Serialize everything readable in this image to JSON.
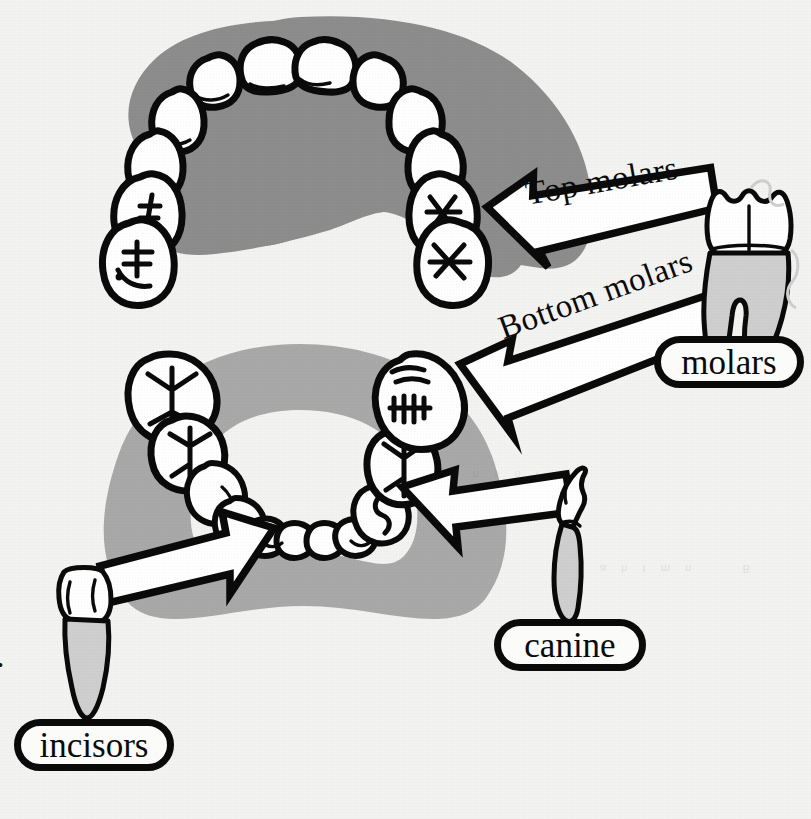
{
  "figure": {
    "background_color": "#f3f3f1",
    "ink_color": "#0a0a0a",
    "tooth_fill": "#ffffff",
    "root_fill": "#cfcfcf",
    "upper_gum_color": "#8d8d8d",
    "lower_gum_color": "#a9a9a9"
  },
  "labels": {
    "molars": "molars",
    "canine": "canine",
    "incisors": "incisors"
  },
  "arrow_labels": {
    "top_molars": "Top molars",
    "bottom_molars": "Bottom molars"
  },
  "edge_artifact": ".",
  "bleed_through": {
    "line_1": "a  h  t  m  n        B",
    "line_2": "i  n  s  o  l"
  },
  "callouts": [
    {
      "id": "top-molars",
      "label": "Top molars",
      "specimen": "molar-tooth",
      "points_to": "upper-jaw-right-molars",
      "arrow_direction": "right-to-left"
    },
    {
      "id": "bottom-molars",
      "label": "Bottom molars",
      "specimen": "molar-tooth",
      "points_to": "lower-jaw-right-molars",
      "arrow_direction": "right-to-left"
    },
    {
      "id": "canine",
      "label": "canine",
      "specimen": "canine-tooth",
      "points_to": "lower-jaw-right-canine",
      "arrow_direction": "right-to-left"
    },
    {
      "id": "incisors",
      "label": "incisors",
      "specimen": "incisor-tooth",
      "points_to": "lower-jaw-front-incisors",
      "arrow_direction": "left-to-right"
    }
  ],
  "jaws": [
    {
      "id": "upper-jaw",
      "name": "Upper jaw (maxilla) occlusal view",
      "gum_color": "#8d8d8d",
      "tooth_count": 14
    },
    {
      "id": "lower-jaw",
      "name": "Lower jaw (mandible) occlusal view",
      "gum_color": "#a9a9a9",
      "tooth_count": 14
    }
  ],
  "specimens": [
    {
      "id": "molar-tooth",
      "name": "Molar tooth with two roots",
      "crown": "#ffffff",
      "root": "#cfcfcf"
    },
    {
      "id": "canine-tooth",
      "name": "Canine tooth, pointed crown",
      "crown": "#ffffff",
      "root": "#cfcfcf"
    },
    {
      "id": "incisor-tooth",
      "name": "Incisor tooth, chisel crown",
      "crown": "#ffffff",
      "root": "#cfcfcf"
    }
  ]
}
